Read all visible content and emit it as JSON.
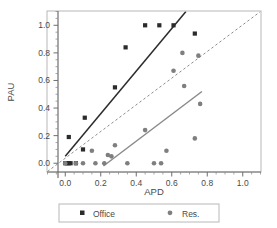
{
  "chart_data": {
    "type": "scatter",
    "title": "",
    "xlabel": "APD",
    "ylabel": "PAU",
    "xlim": [
      -0.1,
      1.1
    ],
    "ylim": [
      -0.06,
      1.1
    ],
    "xticks": [
      0.0,
      0.2,
      0.4,
      0.6,
      0.8,
      1.0
    ],
    "xticklabels": [
      "0.0",
      "0.2",
      "0.4",
      "0.6",
      "0.8",
      "1.0"
    ],
    "yticks": [
      0.0,
      0.2,
      0.4,
      0.6,
      0.8,
      1.0
    ],
    "yticklabels": [
      "0.0",
      "0.2",
      "0.4",
      "0.6",
      "0.8",
      "1.0"
    ],
    "minor_ticks": true,
    "grid": false,
    "legend_position": "below",
    "series": [
      {
        "name": "Office",
        "marker": "square",
        "color": "#2b2b2b",
        "points": [
          [
            0.0,
            0.0
          ],
          [
            0.01,
            0.0
          ],
          [
            0.02,
            0.0
          ],
          [
            0.03,
            0.0
          ],
          [
            0.02,
            0.19
          ],
          [
            0.06,
            0.0
          ],
          [
            0.1,
            0.1
          ],
          [
            0.11,
            0.33
          ],
          [
            0.28,
            0.55
          ],
          [
            0.34,
            0.84
          ],
          [
            0.45,
            1.0
          ],
          [
            0.53,
            1.0
          ],
          [
            0.61,
            1.0
          ],
          [
            0.73,
            0.94
          ]
        ]
      },
      {
        "name": "Res.",
        "marker": "circle",
        "color": "#7f7f7f",
        "points": [
          [
            0.0,
            0.0
          ],
          [
            0.06,
            0.0
          ],
          [
            0.1,
            0.0
          ],
          [
            0.15,
            0.09
          ],
          [
            0.17,
            0.0
          ],
          [
            0.22,
            0.0
          ],
          [
            0.26,
            0.05
          ],
          [
            0.24,
            0.06
          ],
          [
            0.28,
            0.13
          ],
          [
            0.35,
            0.0
          ],
          [
            0.45,
            0.24
          ],
          [
            0.5,
            0.0
          ],
          [
            0.54,
            0.0
          ],
          [
            0.57,
            0.09
          ],
          [
            0.61,
            0.67
          ],
          [
            0.66,
            0.8
          ],
          [
            0.67,
            0.56
          ],
          [
            0.73,
            0.18
          ],
          [
            0.75,
            0.78
          ],
          [
            0.76,
            0.43
          ]
        ]
      }
    ],
    "fit_lines": [
      {
        "name": "office-fit",
        "style": "solid",
        "color": "#2b2b2b",
        "x1": 0.0,
        "y1": 0.05,
        "x2": 0.68,
        "y2": 1.1
      },
      {
        "name": "res-fit",
        "style": "solid",
        "color": "#8a8a8a",
        "x1": 0.215,
        "y1": -0.02,
        "x2": 0.77,
        "y2": 0.52
      },
      {
        "name": "one-to-one-reference",
        "style": "dashed",
        "color": "#8a8a8a",
        "x1": -0.1,
        "y1": -0.06,
        "x2": 1.1,
        "y2": 1.1
      }
    ],
    "legend": [
      {
        "label": "Office",
        "marker": "square",
        "color": "#2b2b2b"
      },
      {
        "label": "Res.",
        "marker": "circle",
        "color": "#7f7f7f"
      }
    ]
  },
  "axis": {
    "xlabel": "APD",
    "ylabel": "PAU"
  },
  "legend": {
    "office_label": "Office",
    "res_label": "Res."
  },
  "ticklabels": {
    "x": [
      "0.0",
      "0.2",
      "0.4",
      "0.6",
      "0.8",
      "1.0"
    ],
    "y": [
      "0.0",
      "0.2",
      "0.4",
      "0.6",
      "0.8",
      "1.0"
    ]
  }
}
